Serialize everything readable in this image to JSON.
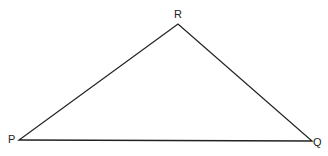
{
  "diagram": {
    "type": "triangle",
    "vertices": [
      {
        "label": "P",
        "x": 19,
        "y": 140
      },
      {
        "label": "Q",
        "x": 312,
        "y": 141
      },
      {
        "label": "R",
        "x": 178,
        "y": 24
      }
    ],
    "edges": [
      [
        "P",
        "Q"
      ],
      [
        "Q",
        "R"
      ],
      [
        "R",
        "P"
      ]
    ],
    "stroke_color": "#222222"
  }
}
